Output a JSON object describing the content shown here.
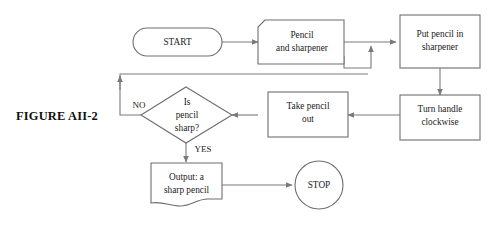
{
  "figure": {
    "caption": "FIGURE AII-2",
    "background_color": "#ffffff",
    "line_color": "#7a7a7a",
    "text_color": "#1b1b1b"
  },
  "nodes": {
    "start": {
      "label": "START",
      "shape": "stadium"
    },
    "input_pencil": {
      "line1": "Pencil",
      "line2": "and sharpener",
      "shape": "input-parallelogram-notched"
    },
    "put_pencil": {
      "line1": "Put pencil in",
      "line2": "sharpener",
      "shape": "process-rectangle"
    },
    "turn_handle": {
      "line1": "Turn handle",
      "line2": "clockwise",
      "shape": "process-rectangle"
    },
    "take_pencil": {
      "line1": "Take pencil",
      "line2": "out",
      "shape": "process-rectangle"
    },
    "decision": {
      "line1": "Is",
      "line2": "pencil",
      "line3": "sharp?",
      "shape": "diamond"
    },
    "output_pencil": {
      "line1": "Output: a",
      "line2": "sharp pencil",
      "shape": "document"
    },
    "stop": {
      "label": "STOP",
      "shape": "circle"
    }
  },
  "edge_labels": {
    "no": "NO",
    "yes": "YES"
  }
}
